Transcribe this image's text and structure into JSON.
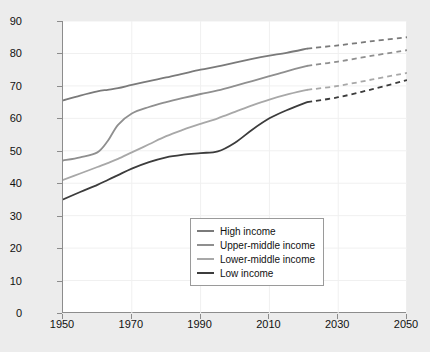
{
  "chart_data": {
    "type": "line",
    "title": "",
    "xlabel": "",
    "ylabel": "Age (years)",
    "xlim": [
      1950,
      2050
    ],
    "ylim": [
      0,
      90
    ],
    "grid": true,
    "xticks": [
      1950,
      1970,
      1990,
      2010,
      2030,
      2050
    ],
    "yticks": [
      0,
      10,
      20,
      30,
      40,
      50,
      60,
      70,
      80,
      90
    ],
    "legend_position": "lower-right",
    "projection_start_year": 2021,
    "note": "Solid segments are historical, dashed segments are projected.",
    "series": [
      {
        "name": "High income",
        "color": "#7a7a7a",
        "x": [
          1950,
          1955,
          1960,
          1963,
          1966,
          1970,
          1975,
          1980,
          1985,
          1990,
          1995,
          2000,
          2005,
          2010,
          2015,
          2021,
          2030,
          2040,
          2050
        ],
        "values": [
          65.5,
          67.0,
          68.3,
          68.8,
          69.3,
          70.3,
          71.5,
          72.6,
          73.8,
          75.0,
          76.0,
          77.2,
          78.3,
          79.3,
          80.2,
          81.5,
          82.5,
          83.8,
          85.0
        ]
      },
      {
        "name": "Upper-middle income",
        "color": "#8f8f8f",
        "x": [
          1950,
          1955,
          1960,
          1963,
          1966,
          1970,
          1975,
          1980,
          1985,
          1990,
          1995,
          2000,
          2005,
          2010,
          2015,
          2021,
          2030,
          2040,
          2050
        ],
        "values": [
          47.0,
          48.0,
          49.5,
          53.0,
          58.0,
          61.5,
          63.5,
          65.0,
          66.3,
          67.5,
          68.6,
          70.0,
          71.5,
          73.0,
          74.5,
          76.2,
          77.5,
          79.3,
          81.0
        ]
      },
      {
        "name": "Lower-middle income",
        "color": "#a8a8a8",
        "x": [
          1950,
          1955,
          1960,
          1963,
          1966,
          1970,
          1975,
          1980,
          1985,
          1990,
          1995,
          2000,
          2005,
          2010,
          2015,
          2021,
          2030,
          2040,
          2050
        ],
        "values": [
          41.0,
          43.0,
          45.0,
          46.2,
          47.5,
          49.5,
          52.0,
          54.5,
          56.5,
          58.3,
          60.0,
          62.0,
          64.0,
          65.8,
          67.3,
          68.8,
          70.0,
          72.0,
          74.0
        ]
      },
      {
        "name": "Low income",
        "color": "#3c3c3c",
        "x": [
          1950,
          1955,
          1960,
          1963,
          1966,
          1970,
          1975,
          1980,
          1985,
          1990,
          1995,
          2000,
          2005,
          2010,
          2015,
          2021,
          2030,
          2040,
          2050
        ],
        "values": [
          35.0,
          37.3,
          39.5,
          41.0,
          42.5,
          44.5,
          46.5,
          48.0,
          48.8,
          49.3,
          49.8,
          52.5,
          56.5,
          60.0,
          62.5,
          65.0,
          66.5,
          69.0,
          71.8
        ]
      }
    ]
  },
  "axes": {
    "y_title": "Age (years)",
    "y_labels": [
      "90",
      "80",
      "70",
      "60",
      "50",
      "40",
      "30",
      "20",
      "10",
      "0"
    ],
    "x_labels": [
      "1950",
      "1970",
      "1990",
      "2010",
      "2030",
      "2050"
    ]
  },
  "legend": {
    "items": [
      {
        "label": "High income",
        "color": "#7a7a7a"
      },
      {
        "label": "Upper-middle income",
        "color": "#8f8f8f"
      },
      {
        "label": "Lower-middle income",
        "color": "#a8a8a8"
      },
      {
        "label": "Low income",
        "color": "#3c3c3c"
      }
    ]
  }
}
